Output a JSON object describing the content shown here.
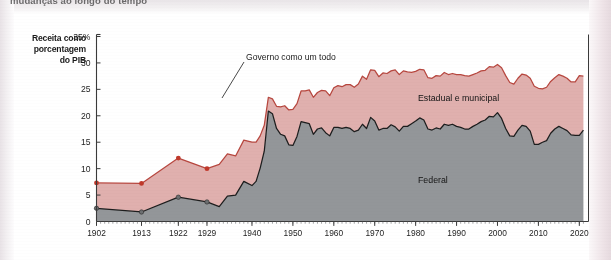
{
  "caption": {
    "text": "mudanças ao longo do tempo"
  },
  "axis_label": {
    "line1": "Receita como",
    "line2": "porcentagem",
    "line3": "do PIB"
  },
  "annotations": {
    "total": "Governo como um todo",
    "state_local": "Estadual e municipal",
    "federal": "Federal"
  },
  "colors": {
    "federal_fill": "#939699",
    "state_local_fill": "#e0b0ae",
    "federal_line": "#1d1d1d",
    "total_line": "#b7473f",
    "marker": "#c0392b",
    "axis": "#3a3a3a",
    "background": "#ffffff"
  },
  "chart_data": {
    "type": "area",
    "title": "",
    "subtitle": "",
    "xlabel": "",
    "ylabel": "Receita como porcentagem do PIB",
    "stacked": true,
    "grid": false,
    "legend_position": "inline-annotations",
    "xlim": [
      1902,
      2022
    ],
    "ylim": [
      0,
      35
    ],
    "yticks": [
      0,
      5,
      10,
      15,
      20,
      25,
      30,
      35
    ],
    "ytick_labels": [
      "0",
      "5",
      "10",
      "15",
      "20",
      "25",
      "30",
      "35%"
    ],
    "xticks": [
      1902,
      1913,
      1922,
      1929,
      1940,
      1950,
      1960,
      1970,
      1980,
      1990,
      2000,
      2010,
      2020
    ],
    "xtick_labels": [
      "1902",
      "1913",
      "1922",
      "1929",
      "1940",
      "1950",
      "1960",
      "1970",
      "1980",
      "1990",
      "2000",
      "2010",
      "2020"
    ],
    "marker_years": [
      1902,
      1913,
      1922,
      1929
    ],
    "series": [
      {
        "name": "Federal",
        "x": [
          1902,
          1913,
          1922,
          1929,
          1932,
          1934,
          1936,
          1938,
          1940,
          1941,
          1942,
          1943,
          1944,
          1945,
          1946,
          1947,
          1948,
          1949,
          1950,
          1951,
          1952,
          1953,
          1954,
          1955,
          1956,
          1957,
          1958,
          1959,
          1960,
          1961,
          1962,
          1963,
          1964,
          1965,
          1966,
          1967,
          1968,
          1969,
          1970,
          1971,
          1972,
          1973,
          1974,
          1975,
          1976,
          1977,
          1978,
          1979,
          1980,
          1981,
          1982,
          1983,
          1984,
          1985,
          1986,
          1987,
          1988,
          1989,
          1990,
          1991,
          1992,
          1993,
          1994,
          1995,
          1996,
          1997,
          1998,
          1999,
          2000,
          2001,
          2002,
          2003,
          2004,
          2005,
          2006,
          2007,
          2008,
          2009,
          2010,
          2011,
          2012,
          2013,
          2014,
          2015,
          2016,
          2017,
          2018,
          2019,
          2020,
          2021
        ],
        "values": [
          2.5,
          1.8,
          4.6,
          3.7,
          2.8,
          4.8,
          5.0,
          7.6,
          6.8,
          7.6,
          10.1,
          13.3,
          20.9,
          20.4,
          17.6,
          16.5,
          16.2,
          14.5,
          14.4,
          16.1,
          18.9,
          18.7,
          18.5,
          16.5,
          17.5,
          17.7,
          16.8,
          16.2,
          17.8,
          17.8,
          17.6,
          17.8,
          17.6,
          17.0,
          17.3,
          18.4,
          17.6,
          19.7,
          19.0,
          17.3,
          17.6,
          17.6,
          18.3,
          17.9,
          17.1,
          18.0,
          18.0,
          18.5,
          19.0,
          19.6,
          19.2,
          17.5,
          17.3,
          17.7,
          17.5,
          18.4,
          18.2,
          18.4,
          18.0,
          17.8,
          17.5,
          17.5,
          18.0,
          18.4,
          18.9,
          19.2,
          19.9,
          19.8,
          20.6,
          19.5,
          17.6,
          16.2,
          16.1,
          17.3,
          18.2,
          18.0,
          17.1,
          14.6,
          14.6,
          15.0,
          15.3,
          16.7,
          17.5,
          18.0,
          17.6,
          17.2,
          16.4,
          16.3,
          16.3,
          17.3
        ]
      },
      {
        "name": "Estadual e municipal",
        "x": [
          1902,
          1913,
          1922,
          1929,
          1932,
          1934,
          1936,
          1938,
          1940,
          1941,
          1942,
          1943,
          1944,
          1945,
          1946,
          1947,
          1948,
          1949,
          1950,
          1951,
          1952,
          1953,
          1954,
          1955,
          1956,
          1957,
          1958,
          1959,
          1960,
          1961,
          1962,
          1963,
          1964,
          1965,
          1966,
          1967,
          1968,
          1969,
          1970,
          1971,
          1972,
          1973,
          1974,
          1975,
          1976,
          1977,
          1978,
          1979,
          1980,
          1981,
          1982,
          1983,
          1984,
          1985,
          1986,
          1987,
          1988,
          1989,
          1990,
          1991,
          1992,
          1993,
          1994,
          1995,
          1996,
          1997,
          1998,
          1999,
          2000,
          2001,
          2002,
          2003,
          2004,
          2005,
          2006,
          2007,
          2008,
          2009,
          2010,
          2011,
          2012,
          2013,
          2014,
          2015,
          2016,
          2017,
          2018,
          2019,
          2020,
          2021
        ],
        "values": [
          4.8,
          5.4,
          7.4,
          6.3,
          8.0,
          8.0,
          7.4,
          7.8,
          8.2,
          7.4,
          6.1,
          4.9,
          2.6,
          2.8,
          4.2,
          5.2,
          5.7,
          6.6,
          6.8,
          6.2,
          5.8,
          6.0,
          6.4,
          7.0,
          6.9,
          7.1,
          7.9,
          7.6,
          7.5,
          7.9,
          7.9,
          8.1,
          8.3,
          8.4,
          8.7,
          9.1,
          9.3,
          9.0,
          9.6,
          10.1,
          10.5,
          10.4,
          10.2,
          10.8,
          10.7,
          10.5,
          10.3,
          9.7,
          9.4,
          9.2,
          9.5,
          9.7,
          9.8,
          9.9,
          10.0,
          9.8,
          9.6,
          9.6,
          9.8,
          10.0,
          10.1,
          10.0,
          9.8,
          9.7,
          9.6,
          9.4,
          9.4,
          9.4,
          9.1,
          9.6,
          10.0,
          10.1,
          9.9,
          9.8,
          9.7,
          9.7,
          10.0,
          11.0,
          10.6,
          10.1,
          10.1,
          9.8,
          9.7,
          9.8,
          9.9,
          9.9,
          10.0,
          10.1,
          11.3,
          10.2
        ]
      }
    ],
    "total_series": {
      "name": "Governo como um todo",
      "note": "soma de Federal + Estadual e municipal"
    }
  }
}
